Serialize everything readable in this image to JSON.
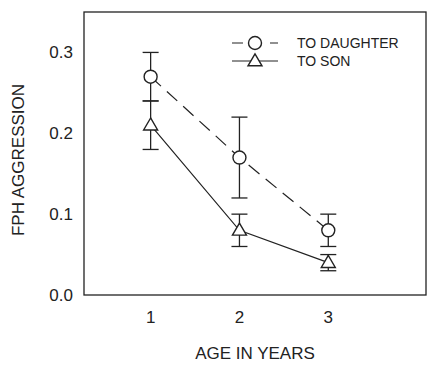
{
  "chart_data": {
    "type": "line",
    "title": "",
    "xlabel": "AGE IN YEARS",
    "ylabel": "FPH AGGRESSION",
    "x": [
      1,
      2,
      3
    ],
    "x_tick_labels": [
      "1",
      "2",
      "3"
    ],
    "xlim": [
      0.25,
      4.1
    ],
    "ylim": [
      0,
      0.35
    ],
    "y_ticks": [
      0.0,
      0.1,
      0.2,
      0.3
    ],
    "y_tick_labels": [
      "0.0",
      "0.1",
      "0.2",
      "0.3"
    ],
    "grid": false,
    "legend_position": "top-right",
    "series": [
      {
        "name": "TO DAUGHTER",
        "marker": "circle",
        "line_style": "dashed",
        "values": [
          0.27,
          0.17,
          0.08
        ],
        "error_low": [
          0.24,
          0.12,
          0.06
        ],
        "error_high": [
          0.3,
          0.22,
          0.1
        ]
      },
      {
        "name": "TO SON",
        "marker": "triangle",
        "line_style": "solid",
        "values": [
          0.21,
          0.08,
          0.04
        ],
        "error_low": [
          0.18,
          0.06,
          0.03
        ],
        "error_high": [
          0.24,
          0.1,
          0.05
        ]
      }
    ],
    "colors": {
      "line": "#222222",
      "background": "#ffffff"
    }
  }
}
